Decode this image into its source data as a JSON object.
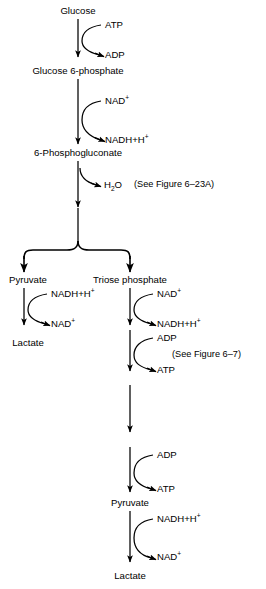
{
  "diagram": {
    "type": "biochemical-pathway-flow-diagram",
    "stroke_color": "#000000",
    "background_color": "#ffffff",
    "metabolites": {
      "glucose": "Glucose",
      "glucose_6_phosphate": "Glucose 6-phosphate",
      "phosphogluconate": "6-Phosphogluconate",
      "pyruvate_left": "Pyruvate",
      "triose_phosphate": "Triose phosphate",
      "lactate_left": "Lactate",
      "pyruvate_bottom": "Pyruvate",
      "lactate_bottom": "Lactate"
    },
    "cofactors": {
      "atp_1_in": "ATP",
      "adp_1_out": "ADP",
      "nad_2_in": "NAD",
      "nadh_2_out": "NADH+H",
      "water_3_out": "H",
      "water_3_out_sub": "2",
      "water_3_out_tail": "O",
      "nadh_left_in": "NADH+H",
      "nad_left_out": "NAD",
      "nad_right_in": "NAD",
      "nadh_right_out": "NADH+H",
      "adp_right_in": "ADP",
      "atp_right_out": "ATP",
      "adp_bottom_in": "ADP",
      "atp_bottom_out": "ATP",
      "nadh_bottom_in": "NADH+H",
      "nad_bottom_out": "NAD"
    },
    "superscripts": {
      "plus": "+"
    },
    "annotations": {
      "figure_ref_1": "(See Figure 6–23A)",
      "figure_ref_2": "(See Figure 6–7)"
    }
  }
}
